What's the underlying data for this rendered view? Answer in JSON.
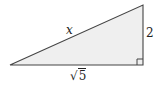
{
  "diagram": {
    "type": "right-triangle",
    "labels": {
      "hypotenuse": "x",
      "vertical_leg": "2",
      "horizontal_leg_radicand": "5",
      "horizontal_leg_symbol": "√"
    },
    "right_angle_marker": true,
    "colors": {
      "fill": "#efefef",
      "stroke": "#444444"
    }
  }
}
